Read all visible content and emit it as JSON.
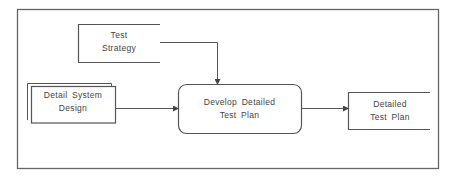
{
  "diagram": {
    "type": "process-flow",
    "colors": {
      "stroke": "#555555",
      "text": "#444444",
      "background": "#ffffff"
    },
    "nodes": {
      "test_strategy": {
        "line1": "Test",
        "line2": "Strategy",
        "shape": "open-data-store"
      },
      "detail_system_design": {
        "line1": "Detail  System",
        "line2": "Design",
        "shape": "stacked-documents"
      },
      "develop_plan": {
        "line1": "Develop  Detailed",
        "line2": "Test  Plan",
        "shape": "rounded-process"
      },
      "detailed_test_plan": {
        "line1": "Detailed",
        "line2": "Test  Plan",
        "shape": "open-data-store"
      }
    },
    "edges": [
      {
        "from": "test_strategy",
        "to": "develop_plan"
      },
      {
        "from": "detail_system_design",
        "to": "develop_plan"
      },
      {
        "from": "develop_plan",
        "to": "detailed_test_plan"
      }
    ]
  }
}
